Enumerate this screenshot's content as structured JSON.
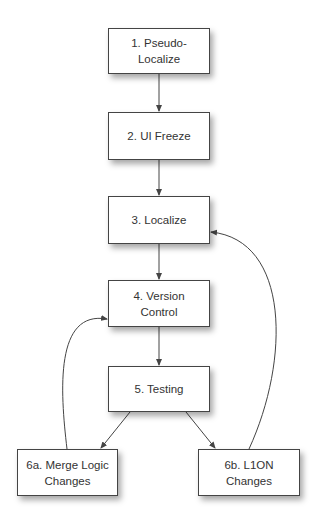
{
  "diagram": {
    "nodes": [
      {
        "id": "n1",
        "lines": [
          "1. Pseudo-",
          "Localize"
        ],
        "x": 108,
        "y": 28,
        "w": 102,
        "h": 46
      },
      {
        "id": "n2",
        "lines": [
          "2. UI Freeze"
        ],
        "x": 108,
        "y": 112,
        "w": 102,
        "h": 48
      },
      {
        "id": "n3",
        "lines": [
          "3. Localize"
        ],
        "x": 108,
        "y": 196,
        "w": 102,
        "h": 48
      },
      {
        "id": "n4",
        "lines": [
          "4. Version",
          "Control"
        ],
        "x": 108,
        "y": 280,
        "w": 102,
        "h": 47
      },
      {
        "id": "n5",
        "lines": [
          "5. Testing"
        ],
        "x": 108,
        "y": 366,
        "w": 102,
        "h": 46
      },
      {
        "id": "n6a",
        "lines": [
          "6a. Merge Logic",
          "Changes"
        ],
        "x": 17,
        "y": 449,
        "w": 101,
        "h": 47
      },
      {
        "id": "n6b",
        "lines": [
          "6b. L1ON",
          "Changes"
        ],
        "x": 198,
        "y": 449,
        "w": 102,
        "h": 47
      }
    ],
    "edges": [
      {
        "from": "1. Pseudo-Localize",
        "to": "2. UI Freeze"
      },
      {
        "from": "2. UI Freeze",
        "to": "3. Localize"
      },
      {
        "from": "3. Localize",
        "to": "4. Version Control"
      },
      {
        "from": "4. Version Control",
        "to": "5. Testing"
      },
      {
        "from": "5. Testing",
        "to": "6a. Merge Logic Changes"
      },
      {
        "from": "5. Testing",
        "to": "6b. L1ON Changes"
      },
      {
        "from": "6a. Merge Logic Changes",
        "to": "4. Version Control"
      },
      {
        "from": "6b. L1ON Changes",
        "to": "3. Localize"
      }
    ],
    "colors": {
      "line": "#444444",
      "box_border": "#444444",
      "text": "#333333"
    }
  }
}
